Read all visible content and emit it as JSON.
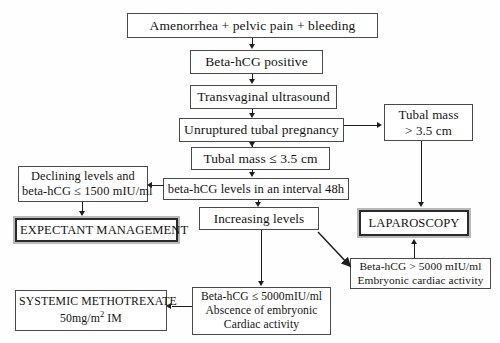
{
  "diagram": {
    "type": "flowchart",
    "background_color": "#fefefe",
    "line_color": "#1d1d1d",
    "box_border_color": "#4a4a4a",
    "highlight_border_color": "#b9b9b9"
  },
  "nodes": {
    "presentation": {
      "line1": "Amenorrhea + pelvic pain + bleeding"
    },
    "beta_hcg_positive": {
      "line1": "Beta-hCG  positive"
    },
    "ultrasound": {
      "line1": "Transvaginal ultrasound"
    },
    "unruptured": {
      "line1": "Unruptured tubal pregnancy"
    },
    "mass_small": {
      "line1": "Tubal mass ≤ 3.5 cm"
    },
    "mass_large": {
      "line1": "Tubal mass",
      "line2": "> 3.5 cm"
    },
    "interval": {
      "line1": "beta-hCG levels in an interval 48h"
    },
    "declining": {
      "line1": "Declining levels  and",
      "line2": "beta-hCG ≤ 1500 mIU/ml"
    },
    "expectant": {
      "line1": "EXPECTANT MANAGEMENT"
    },
    "increasing": {
      "line1": "Increasing levels"
    },
    "laparoscopy": {
      "line1": "LAPAROSCOPY"
    },
    "high_hcg": {
      "line1": "Beta-hCG > 5000 mIU/ml",
      "line2": "Embryonic cardiac activity"
    },
    "low_hcg": {
      "line1": "Beta-hCG ≤ 5000mIU/ml",
      "line2": "Abscence of embryonic",
      "line3": "Cardiac activity"
    },
    "methotrexate": {
      "line1": "SYSTEMIC METHOTREXATE",
      "line2_pre": "50mg/m",
      "line2_sup": "2",
      "line2_post": "  IM"
    }
  },
  "edges": [
    {
      "from": "presentation",
      "to": "beta_hcg_positive",
      "kind": "down-arrow"
    },
    {
      "from": "beta_hcg_positive",
      "to": "ultrasound",
      "kind": "down-arrow"
    },
    {
      "from": "ultrasound",
      "to": "unruptured",
      "kind": "down-arrow"
    },
    {
      "from": "unruptured",
      "to": "mass_small",
      "kind": "down-arrow"
    },
    {
      "from": "unruptured",
      "to": "mass_large",
      "kind": "right-arrow"
    },
    {
      "from": "mass_small",
      "to": "interval",
      "kind": "down-arrow"
    },
    {
      "from": "interval",
      "to": "declining",
      "kind": "left-arrow"
    },
    {
      "from": "declining",
      "to": "expectant",
      "kind": "down-arrow"
    },
    {
      "from": "interval",
      "to": "increasing",
      "kind": "down-arrow"
    },
    {
      "from": "mass_large",
      "to": "laparoscopy",
      "kind": "down-arrow"
    },
    {
      "from": "increasing",
      "to": "high_hcg",
      "kind": "diagonal-arrow"
    },
    {
      "from": "high_hcg",
      "to": "laparoscopy",
      "kind": "up-arrow"
    },
    {
      "from": "increasing",
      "to": "low_hcg",
      "kind": "down-arrow"
    },
    {
      "from": "low_hcg",
      "to": "methotrexate",
      "kind": "left-arrow"
    }
  ]
}
